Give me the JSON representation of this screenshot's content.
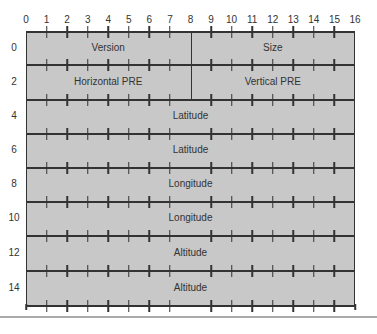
{
  "diagram": {
    "bit_labels": [
      "0",
      "1",
      "2",
      "3",
      "4",
      "5",
      "6",
      "7",
      "8",
      "9",
      "10",
      "11",
      "12",
      "13",
      "14",
      "15",
      "16"
    ],
    "row_labels": [
      "0",
      "2",
      "4",
      "6",
      "8",
      "10",
      "12",
      "14"
    ],
    "rows": [
      {
        "fields": [
          {
            "label": "Version",
            "start": 0,
            "end": 8
          },
          {
            "label": "Size",
            "start": 8,
            "end": 16
          }
        ]
      },
      {
        "fields": [
          {
            "label": "Horizontal PRE",
            "start": 0,
            "end": 8
          },
          {
            "label": "Vertical PRE",
            "start": 8,
            "end": 16
          }
        ]
      },
      {
        "fields": [
          {
            "label": "Latitude",
            "start": 0,
            "end": 16
          }
        ]
      },
      {
        "fields": [
          {
            "label": "Latitude",
            "start": 0,
            "end": 16
          }
        ]
      },
      {
        "fields": [
          {
            "label": "Longitude",
            "start": 0,
            "end": 16
          }
        ]
      },
      {
        "fields": [
          {
            "label": "Longitude",
            "start": 0,
            "end": 16
          }
        ]
      },
      {
        "fields": [
          {
            "label": "Altitude",
            "start": 0,
            "end": 16
          }
        ]
      },
      {
        "fields": [
          {
            "label": "Altitude",
            "start": 0,
            "end": 16
          }
        ]
      }
    ],
    "colors": {
      "fill": "#c8c8c8",
      "line": "#333333",
      "separator": "#aaaaaa"
    }
  }
}
